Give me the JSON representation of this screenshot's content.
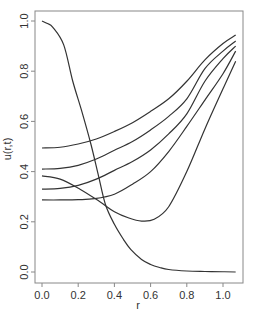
{
  "chart_data": {
    "type": "line",
    "title": "",
    "xlabel": "r",
    "ylabel": "u(r,t)",
    "xlim": [
      -0.03,
      1.11
    ],
    "ylim": [
      -0.04,
      1.04
    ],
    "xticks": [
      0.0,
      0.2,
      0.4,
      0.6,
      0.8,
      1.0
    ],
    "xtick_labels": [
      "0.0",
      "0.2",
      "0.4",
      "0.6",
      "0.8",
      "1.0"
    ],
    "yticks": [
      0.0,
      0.2,
      0.4,
      0.6,
      0.8,
      1.0
    ],
    "ytick_labels": [
      "0.0",
      "0.2",
      "0.4",
      "0.6",
      "0.8",
      "1.0"
    ],
    "grid": false,
    "legend": null,
    "line_color": "#333333",
    "series": [
      {
        "name": "curve-1",
        "x": [
          0.0,
          0.03,
          0.06,
          0.12,
          0.17,
          0.22,
          0.27,
          0.31,
          0.35,
          0.4,
          0.45,
          0.49,
          0.55,
          0.6,
          0.65,
          0.7,
          0.8,
          0.9,
          1.0,
          1.07
        ],
        "y": [
          1.0,
          0.99,
          0.975,
          0.905,
          0.76,
          0.64,
          0.51,
          0.39,
          0.27,
          0.19,
          0.13,
          0.09,
          0.05,
          0.03,
          0.018,
          0.01,
          0.004,
          0.002,
          0.001,
          0.0
        ]
      },
      {
        "name": "curve-2",
        "x": [
          0.0,
          0.1,
          0.21,
          0.32,
          0.4,
          0.48,
          0.55,
          0.62,
          0.7,
          0.8,
          0.9,
          1.0,
          1.07
        ],
        "y": [
          0.383,
          0.37,
          0.33,
          0.28,
          0.24,
          0.215,
          0.203,
          0.21,
          0.26,
          0.4,
          0.57,
          0.73,
          0.84
        ]
      },
      {
        "name": "curve-3",
        "x": [
          0.0,
          0.1,
          0.2,
          0.29,
          0.4,
          0.5,
          0.6,
          0.7,
          0.8,
          0.9,
          1.0,
          1.07
        ],
        "y": [
          0.287,
          0.287,
          0.288,
          0.292,
          0.31,
          0.35,
          0.4,
          0.48,
          0.58,
          0.685,
          0.79,
          0.88
        ]
      },
      {
        "name": "curve-4",
        "x": [
          0.0,
          0.1,
          0.2,
          0.3,
          0.4,
          0.5,
          0.6,
          0.7,
          0.8,
          0.9,
          1.0,
          1.07
        ],
        "y": [
          0.33,
          0.333,
          0.345,
          0.37,
          0.405,
          0.44,
          0.486,
          0.55,
          0.63,
          0.76,
          0.85,
          0.9
        ]
      },
      {
        "name": "curve-5",
        "x": [
          0.0,
          0.1,
          0.2,
          0.3,
          0.4,
          0.5,
          0.6,
          0.7,
          0.8,
          0.9,
          1.0,
          1.07
        ],
        "y": [
          0.41,
          0.413,
          0.425,
          0.45,
          0.485,
          0.52,
          0.566,
          0.62,
          0.69,
          0.81,
          0.88,
          0.92
        ]
      },
      {
        "name": "curve-6",
        "x": [
          0.0,
          0.1,
          0.2,
          0.3,
          0.4,
          0.5,
          0.6,
          0.7,
          0.8,
          0.9,
          1.0,
          1.07
        ],
        "y": [
          0.494,
          0.497,
          0.51,
          0.53,
          0.56,
          0.595,
          0.64,
          0.69,
          0.76,
          0.845,
          0.91,
          0.944
        ]
      }
    ]
  }
}
